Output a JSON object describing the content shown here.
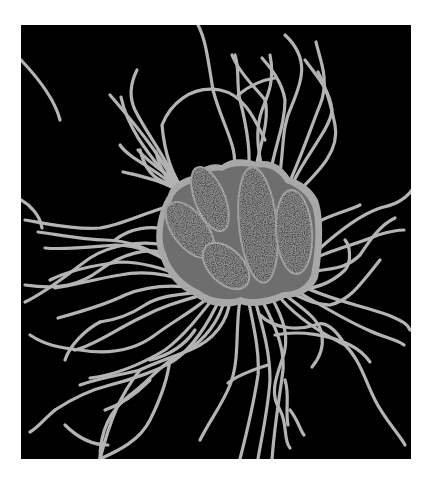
{
  "image": {
    "description": "Grayscale micrograph-style illustration of a cluster of rod-shaped bacteria with numerous flagella on a black background",
    "subject": "Bacterial cluster with flagella",
    "background_color": "#000000",
    "page_color": "#ffffff",
    "panel": {
      "x": 21,
      "y": 25,
      "width": 390,
      "height": 434
    },
    "colors": {
      "flagella": "#b4b4b4",
      "capsule_outer": "#a8a8a8",
      "capsule_inner": "#6e6e6e",
      "rod_fill": "#4a4a4a",
      "rod_edge": "#8c8c8c"
    },
    "cell_count": 5
  }
}
